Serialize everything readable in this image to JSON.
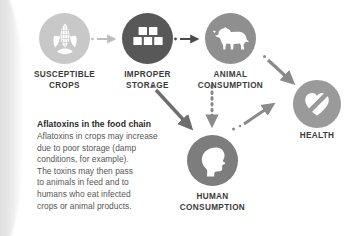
{
  "diagram": {
    "nodes": [
      {
        "id": "susceptible-crops",
        "label": "SUSCEPTIBLE\nCROPS",
        "icon": "corn-icon",
        "circle_color": "#c8c8c8",
        "icon_color": "#ffffff"
      },
      {
        "id": "improper-storage",
        "label": "IMPROPER\nSTORAGE",
        "icon": "stacked-boxes-icon",
        "circle_color": "#585858",
        "icon_color": "#ffffff"
      },
      {
        "id": "animal-consumption",
        "label": "ANIMAL\nCONSUMPTION",
        "icon": "cow-icon",
        "circle_color": "#8f8f8f",
        "icon_color": "#ffffff"
      },
      {
        "id": "health",
        "label": "HEALTH",
        "icon": "heart-slash-icon",
        "circle_color": "#9a9a9a",
        "icon_color": "#ffffff"
      },
      {
        "id": "human-consumption",
        "label": "HUMAN\nCONSUMPTION",
        "icon": "human-head-icon",
        "circle_color": "#7d7d7d",
        "icon_color": "#ffffff"
      }
    ],
    "connectors": [
      {
        "id": "crops-to-storage",
        "from": "susceptible-crops",
        "to": "improper-storage",
        "color": "#bdbdbd",
        "style": "dotted-start-arrow"
      },
      {
        "id": "storage-to-animal",
        "from": "improper-storage",
        "to": "animal-consumption",
        "color": "#4a4a4a",
        "style": "dotted-start-arrow"
      },
      {
        "id": "animal-to-health",
        "from": "animal-consumption",
        "to": "health",
        "color": "#8a8a8a",
        "style": "dotted-start-arrow"
      },
      {
        "id": "storage-to-human",
        "from": "improper-storage",
        "to": "human-consumption",
        "color": "#6e6e6e",
        "style": "dotted-start-arrow"
      },
      {
        "id": "animal-to-human",
        "from": "animal-consumption",
        "to": "human-consumption",
        "color": "#8a8a8a",
        "style": "dotted-line-arrow"
      },
      {
        "id": "human-to-health",
        "from": "human-consumption",
        "to": "health",
        "color": "#8a8a8a",
        "style": "dotted-start-arrow"
      }
    ]
  },
  "caption": {
    "title": "Aflatoxins in the food chain",
    "body": "Aflatoxins in crops may increase\ndue to poor storage (damp\nconditions, for example).\nThe toxins may then pass\nto animals in feed and to\nhumans who eat infected\ncrops or animal products."
  },
  "colors": {
    "background": "#ffffff",
    "label_text": "#3b3b3b",
    "caption_title": "#2b2b2b",
    "caption_body": "#575757"
  }
}
